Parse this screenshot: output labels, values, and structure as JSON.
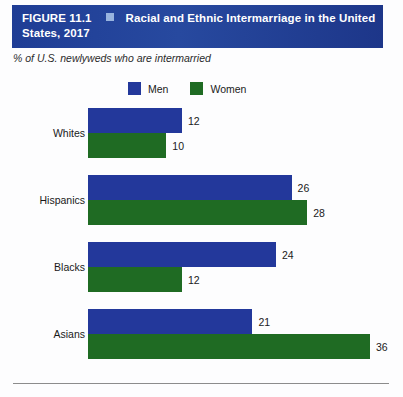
{
  "header": {
    "figure_label": "FIGURE 11.1",
    "bullet": "square-bullet",
    "title_line1": "Racial and Ethnic Intermarriage in the United",
    "title_line2": "States, 2017",
    "bar_color": "#1f3d95",
    "bullet_color": "#98b4df"
  },
  "subtitle": "% of U.S. newlyweds who are intermarried",
  "legend": {
    "items": [
      {
        "label": "Men",
        "color": "#23389b"
      },
      {
        "label": "Women",
        "color": "#1f6b23"
      }
    ]
  },
  "chart_data": {
    "type": "bar",
    "orientation": "horizontal",
    "title": "Racial and Ethnic Intermarriage in the United States, 2017",
    "subtitle": "% of U.S. newlyweds who are intermarried",
    "xlabel": "",
    "ylabel": "",
    "categories": [
      "Whites",
      "Hispanics",
      "Blacks",
      "Asians"
    ],
    "series": [
      {
        "name": "Men",
        "color": "#23389b",
        "values": [
          12,
          26,
          24,
          21
        ]
      },
      {
        "name": "Women",
        "color": "#1f6b23",
        "values": [
          10,
          28,
          12,
          36
        ]
      }
    ],
    "xlim": [
      0,
      36
    ],
    "grid": false,
    "legend_position": "top",
    "data_labels": true
  }
}
